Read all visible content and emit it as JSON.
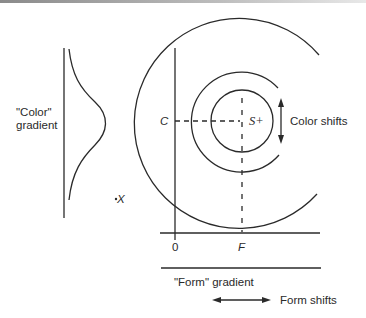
{
  "diagram": {
    "left_panel": {
      "label_line1": "\"Color\"",
      "label_line2": "gradient"
    },
    "main_panel": {
      "axis_y_label": "C",
      "axis_x_origin": "0",
      "axis_x_label": "F",
      "center_label": "S+",
      "point_label": "X",
      "color_shift_label": "Color shifts",
      "form_gradient_label": "\"Form\" gradient",
      "form_shift_label": "Form shifts"
    },
    "colors": {
      "stroke": "#2a2a2a",
      "background": "#ffffff"
    }
  }
}
